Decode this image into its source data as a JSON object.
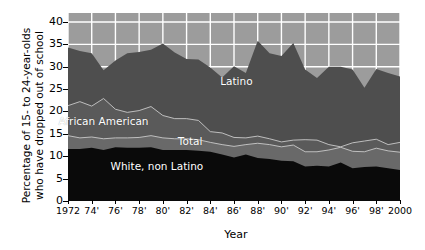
{
  "chart_data": {
    "type": "area",
    "title": "",
    "xlabel": "Year",
    "ylabel": "Percentage of 15- to 24-year-olds\nwho have dropped out of school",
    "xlim": [
      1972,
      2000
    ],
    "ylim": [
      0,
      42
    ],
    "grid": true,
    "grid_color": "#ffffff",
    "legend_position": "inline-annotations",
    "background_color": "#9c9c9c",
    "x": [
      1972,
      1973,
      1974,
      1975,
      1976,
      1977,
      1978,
      1979,
      1980,
      1981,
      1982,
      1983,
      1984,
      1985,
      1986,
      1987,
      1988,
      1989,
      1990,
      1991,
      1992,
      1993,
      1994,
      1995,
      1996,
      1997,
      1998,
      1999,
      2000
    ],
    "x_tick_labels": [
      "1972",
      "74'",
      "76'",
      "78'",
      "80'",
      "82'",
      "84'",
      "86'",
      "88'",
      "90'",
      "92'",
      "94'",
      "96'",
      "98'",
      "2000"
    ],
    "x_tick_values": [
      1972,
      1974,
      1976,
      1978,
      1980,
      1982,
      1984,
      1986,
      1988,
      1990,
      1992,
      1994,
      1996,
      1998,
      2000
    ],
    "y_tick_labels": [
      "0",
      "5",
      "10",
      "15",
      "20",
      "25",
      "30",
      "35",
      "40"
    ],
    "y_tick_values": [
      0,
      5,
      10,
      15,
      20,
      25,
      30,
      35,
      40
    ],
    "series": [
      {
        "name": "Latino",
        "color": "#4e4e4e",
        "label_x": 1986.2,
        "label_y": 26.5,
        "values": [
          34.3,
          33.5,
          33.0,
          29.2,
          31.4,
          33.0,
          33.3,
          33.8,
          35.2,
          33.2,
          31.7,
          31.6,
          29.8,
          27.6,
          30.1,
          28.6,
          35.8,
          33.0,
          32.4,
          35.3,
          29.4,
          27.5,
          30.0,
          30.0,
          29.4,
          25.3,
          29.5,
          28.6,
          27.8
        ]
      },
      {
        "name": "African American",
        "color": "#5a5a5a",
        "label_x": 1975.0,
        "label_y": 17.7,
        "values": [
          21.3,
          22.2,
          21.2,
          22.9,
          20.5,
          19.8,
          20.2,
          21.1,
          19.1,
          18.4,
          18.4,
          18.0,
          15.5,
          15.2,
          14.2,
          14.1,
          14.5,
          13.9,
          13.2,
          13.6,
          13.7,
          13.6,
          12.6,
          12.1,
          13.0,
          13.4,
          13.8,
          12.6,
          13.1
        ]
      },
      {
        "name": "Total",
        "color": "#696969",
        "label_x": 1982.3,
        "label_y": 13.2,
        "values": [
          14.6,
          14.1,
          14.3,
          13.9,
          14.1,
          14.1,
          14.2,
          14.6,
          14.1,
          13.9,
          13.9,
          13.7,
          13.1,
          12.6,
          12.2,
          12.6,
          12.9,
          12.6,
          12.1,
          12.5,
          11.0,
          11.0,
          11.4,
          12.0,
          11.1,
          11.0,
          11.8,
          11.2,
          10.9
        ]
      },
      {
        "name": "White, non Latino",
        "color": "#0a0a0a",
        "label_x": 1979.5,
        "label_y": 7.5,
        "values": [
          11.6,
          11.6,
          11.9,
          11.4,
          12.0,
          11.9,
          11.9,
          12.0,
          11.4,
          11.4,
          11.4,
          11.2,
          11.0,
          10.4,
          9.7,
          10.4,
          9.6,
          9.4,
          9.0,
          8.9,
          7.7,
          7.9,
          7.7,
          8.6,
          7.3,
          7.6,
          7.7,
          7.3,
          6.9
        ]
      }
    ]
  }
}
